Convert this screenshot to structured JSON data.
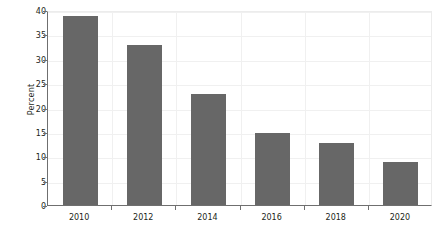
{
  "chart_data": {
    "type": "bar",
    "title": "",
    "subtitle": "",
    "xlabel": "",
    "ylabel": "Percent",
    "categories": [
      "2010",
      "2012",
      "2014",
      "2016",
      "2018",
      "2020"
    ],
    "values": [
      38.8,
      32.8,
      22.8,
      14.7,
      12.7,
      8.8
    ],
    "series": [
      {
        "name": "Percent",
        "values": [
          38.8,
          32.8,
          22.8,
          14.7,
          12.7,
          8.8
        ]
      }
    ],
    "ylim": [
      0,
      40
    ],
    "yticks": [
      "0",
      "5",
      "10",
      "15",
      "20",
      "25",
      "30",
      "35",
      "40"
    ],
    "ytick_values": [
      0,
      5,
      10,
      15,
      20,
      25,
      30,
      35,
      40
    ],
    "xticklabels": [
      "2010",
      "2012",
      "2014",
      "2016",
      "2018",
      "2020"
    ],
    "grid": true,
    "grid_axis": "both",
    "legend": false,
    "legend_position": "none",
    "bar_color": "#676767",
    "axis_color": "#6f6f6f",
    "grid_color": "#f0f0f0",
    "text_color": "#231f20",
    "background": "#ffffff"
  }
}
